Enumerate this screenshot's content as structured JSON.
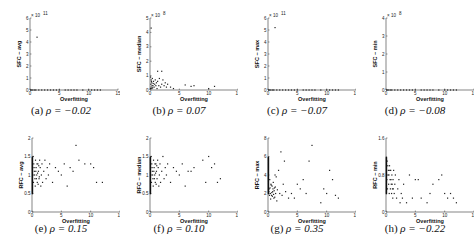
{
  "chart_data": [
    {
      "id": "a",
      "type": "scatter",
      "caption_letter": "(a)",
      "rho_label": "ρ = −0.02",
      "xlabel": "Overfitting",
      "ylabel": "SFC − avg",
      "xlim": [
        0,
        15
      ],
      "xticks": [
        "0",
        "5",
        "10",
        "15"
      ],
      "ylim": [
        0,
        6
      ],
      "yticks": [
        "0",
        "1",
        "2",
        "3",
        "4",
        "5",
        "6"
      ],
      "y_exponent": "x 10^11",
      "points": [
        [
          1.2,
          4.4
        ],
        [
          0.1,
          0
        ],
        [
          0.3,
          0
        ],
        [
          0.5,
          0
        ],
        [
          0.8,
          0
        ],
        [
          1,
          0
        ],
        [
          1.5,
          0
        ],
        [
          2,
          0
        ],
        [
          2.5,
          0
        ],
        [
          3,
          0
        ],
        [
          3.5,
          0
        ],
        [
          4,
          0
        ],
        [
          4.5,
          0
        ],
        [
          5,
          0
        ],
        [
          6,
          0
        ],
        [
          6.5,
          0
        ],
        [
          7,
          0
        ],
        [
          7.5,
          0
        ],
        [
          8,
          0
        ],
        [
          9,
          0
        ],
        [
          10,
          0
        ],
        [
          10.5,
          0
        ],
        [
          11,
          0
        ],
        [
          11.5,
          0
        ],
        [
          12,
          0
        ]
      ]
    },
    {
      "id": "b",
      "type": "scatter",
      "caption_letter": "(b)",
      "rho_label": "ρ = 0.07",
      "xlabel": "Overfitting",
      "ylabel": "SFC − median",
      "xlim": [
        0,
        15
      ],
      "xticks": [
        "0",
        "5",
        "10",
        "15"
      ],
      "ylim": [
        0,
        5
      ],
      "yticks": [
        "0",
        "1",
        "2",
        "3",
        "4",
        "5"
      ],
      "y_exponent": "x 10^8",
      "points": [
        [
          0.2,
          4.3
        ],
        [
          0.1,
          0.9
        ],
        [
          0.2,
          0.7
        ],
        [
          0.3,
          0.5
        ],
        [
          0.4,
          0.8
        ],
        [
          0.5,
          0.3
        ],
        [
          0.6,
          0.6
        ],
        [
          0.7,
          0.2
        ],
        [
          0.8,
          0.4
        ],
        [
          0.9,
          0.7
        ],
        [
          1,
          0.3
        ],
        [
          1.1,
          0.5
        ],
        [
          1.2,
          0.1
        ],
        [
          1.3,
          0.6
        ],
        [
          1.5,
          0.3
        ],
        [
          1.6,
          0.8
        ],
        [
          1.8,
          0.2
        ],
        [
          2,
          0.4
        ],
        [
          2.2,
          0.7
        ],
        [
          2.4,
          0.3
        ],
        [
          2.6,
          0.5
        ],
        [
          2.8,
          0.2
        ],
        [
          3,
          0.4
        ],
        [
          1.3,
          1.3
        ],
        [
          2,
          1.3
        ],
        [
          3.5,
          0.2
        ],
        [
          4,
          0.1
        ],
        [
          6,
          0.35
        ],
        [
          7,
          0.25
        ],
        [
          7.5,
          0.3
        ],
        [
          10,
          0.1
        ],
        [
          11,
          0.25
        ],
        [
          0.1,
          0.1
        ],
        [
          0.2,
          0.2
        ],
        [
          0.3,
          0.1
        ],
        [
          0.15,
          0.4
        ],
        [
          0.25,
          0.6
        ],
        [
          0.35,
          0.3
        ],
        [
          0.45,
          0.15
        ],
        [
          0.55,
          0.45
        ]
      ]
    },
    {
      "id": "c",
      "type": "scatter",
      "caption_letter": "(c)",
      "rho_label": "ρ = −0.07",
      "xlabel": "Overfitting",
      "ylabel": "SFC − max",
      "xlim": [
        0,
        15
      ],
      "xticks": [
        "0",
        "5",
        "10",
        "15"
      ],
      "ylim": [
        0,
        6
      ],
      "yticks": [
        "0",
        "1",
        "2",
        "3",
        "4",
        "5",
        "6"
      ],
      "y_exponent": "x 10^11",
      "points": [
        [
          1.2,
          5.2
        ],
        [
          0.1,
          0
        ],
        [
          0.3,
          0
        ],
        [
          0.5,
          0
        ],
        [
          0.8,
          0
        ],
        [
          1,
          0
        ],
        [
          1.5,
          0
        ],
        [
          2,
          0
        ],
        [
          2.5,
          0
        ],
        [
          3,
          0
        ],
        [
          3.5,
          0
        ],
        [
          4,
          0
        ],
        [
          4.5,
          0
        ],
        [
          5,
          0
        ],
        [
          6,
          0
        ],
        [
          6.5,
          0
        ],
        [
          7,
          0
        ],
        [
          7.5,
          0
        ],
        [
          8,
          0
        ],
        [
          9,
          0
        ],
        [
          10,
          0
        ],
        [
          10.5,
          0
        ],
        [
          11,
          0
        ],
        [
          11.5,
          0
        ],
        [
          12,
          0
        ]
      ]
    },
    {
      "id": "d",
      "type": "scatter",
      "caption_letter": "(d)",
      "rho_label": "ρ = −0.08",
      "xlabel": "Overfitting",
      "ylabel": "SFC − min",
      "xlim": [
        0,
        15
      ],
      "xticks": [
        "0",
        "5",
        "10",
        "15"
      ],
      "ylim": [
        0,
        4
      ],
      "yticks": [
        "0",
        "1",
        "2",
        "3",
        "4"
      ],
      "y_exponent": "x 10^8",
      "points": [
        [
          0.1,
          0
        ],
        [
          0.3,
          0
        ],
        [
          0.5,
          0
        ],
        [
          0.8,
          0
        ],
        [
          1,
          0
        ],
        [
          1.5,
          0
        ],
        [
          2,
          0
        ],
        [
          2.5,
          0
        ],
        [
          3,
          0
        ],
        [
          3.5,
          0
        ],
        [
          4,
          0
        ],
        [
          4.5,
          0
        ],
        [
          5,
          0
        ],
        [
          6,
          0
        ],
        [
          6.5,
          0
        ],
        [
          7,
          0
        ],
        [
          7.5,
          0
        ],
        [
          8,
          0
        ],
        [
          9,
          0
        ],
        [
          10,
          0
        ],
        [
          10.5,
          0
        ],
        [
          11,
          0
        ],
        [
          11.5,
          0
        ],
        [
          12,
          0
        ]
      ]
    },
    {
      "id": "e",
      "type": "scatter",
      "caption_letter": "(e)",
      "rho_label": "ρ = 0.15",
      "xlabel": "Overfitting",
      "ylabel": "RFC − avg",
      "xlim": [
        0,
        15
      ],
      "xticks": [
        "0",
        "5",
        "10",
        "15"
      ],
      "ylim": [
        0,
        2
      ],
      "yticks": [
        "0",
        "0.5",
        "1",
        "1.5",
        "2"
      ],
      "y_exponent": "",
      "points": [
        [
          0.2,
          1.5
        ],
        [
          0.3,
          1.3
        ],
        [
          0.4,
          1.1
        ],
        [
          0.5,
          0.9
        ],
        [
          0.6,
          1.4
        ],
        [
          0.7,
          1.2
        ],
        [
          0.8,
          1.0
        ],
        [
          0.9,
          0.8
        ],
        [
          1.0,
          1.3
        ],
        [
          1.1,
          1.1
        ],
        [
          1.2,
          0.9
        ],
        [
          1.3,
          1.4
        ],
        [
          1.4,
          1.2
        ],
        [
          1.5,
          0.7
        ],
        [
          1.6,
          1.0
        ],
        [
          1.7,
          1.3
        ],
        [
          1.8,
          0.8
        ],
        [
          2.0,
          1.1
        ],
        [
          2.2,
          1.4
        ],
        [
          2.4,
          0.9
        ],
        [
          2.6,
          1.2
        ],
        [
          2.8,
          1.0
        ],
        [
          3,
          1.3
        ],
        [
          3.5,
          0.8
        ],
        [
          4,
          1.2
        ],
        [
          4.5,
          1.1
        ],
        [
          5,
          1.0
        ],
        [
          5.5,
          1.3
        ],
        [
          6,
          0.7
        ],
        [
          6.5,
          1.2
        ],
        [
          7,
          1.1
        ],
        [
          7.5,
          1.8
        ],
        [
          8,
          1.4
        ],
        [
          9,
          1.3
        ],
        [
          10,
          1.3
        ],
        [
          10.5,
          1.2
        ],
        [
          11,
          0.8
        ],
        [
          12,
          0.8
        ],
        [
          0.15,
          1.0
        ],
        [
          0.25,
          0.8
        ],
        [
          0.35,
          1.2
        ],
        [
          0.45,
          1.0
        ],
        [
          0.55,
          0.7
        ],
        [
          0.65,
          1.1
        ],
        [
          0.75,
          0.9
        ],
        [
          0.85,
          1.3
        ],
        [
          0.95,
          1.05
        ],
        [
          1.05,
          0.75
        ],
        [
          1.15,
          1.25
        ],
        [
          1.25,
          0.95
        ]
      ]
    },
    {
      "id": "f",
      "type": "scatter",
      "caption_letter": "(f)",
      "rho_label": "ρ = 0.10",
      "xlabel": "Overfitting",
      "ylabel": "RFC − median",
      "xlim": [
        0,
        15
      ],
      "xticks": [
        "0",
        "5",
        "10",
        "15"
      ],
      "ylim": [
        0,
        2
      ],
      "yticks": [
        "0",
        "0.5",
        "1",
        "1.5",
        "2"
      ],
      "y_exponent": "",
      "points": [
        [
          0.2,
          1.5
        ],
        [
          0.3,
          1.3
        ],
        [
          0.4,
          1.1
        ],
        [
          0.5,
          0.9
        ],
        [
          0.6,
          1.4
        ],
        [
          0.7,
          1.2
        ],
        [
          0.8,
          1.0
        ],
        [
          0.9,
          0.8
        ],
        [
          1.0,
          1.3
        ],
        [
          1.1,
          1.1
        ],
        [
          1.2,
          0.9
        ],
        [
          1.3,
          1.4
        ],
        [
          1.4,
          1.2
        ],
        [
          1.5,
          0.7
        ],
        [
          1.6,
          1.0
        ],
        [
          1.7,
          1.3
        ],
        [
          1.8,
          0.8
        ],
        [
          2.0,
          1.1
        ],
        [
          2.2,
          1.5
        ],
        [
          2.4,
          0.9
        ],
        [
          2.6,
          1.2
        ],
        [
          2.8,
          1.0
        ],
        [
          3,
          1.3
        ],
        [
          3.5,
          0.8
        ],
        [
          4,
          1.2
        ],
        [
          4.5,
          1.1
        ],
        [
          5,
          1.0
        ],
        [
          5.5,
          1.3
        ],
        [
          6,
          0.7
        ],
        [
          6.5,
          1.1
        ],
        [
          7,
          1.1
        ],
        [
          7.5,
          1.2
        ],
        [
          9,
          1.4
        ],
        [
          9.5,
          0.8
        ],
        [
          10,
          1.5
        ],
        [
          10.5,
          1.2
        ],
        [
          11,
          1.3
        ],
        [
          11.5,
          0.8
        ],
        [
          12,
          0.9
        ],
        [
          0.15,
          1.0
        ],
        [
          0.25,
          0.8
        ],
        [
          0.35,
          1.2
        ],
        [
          0.45,
          1.0
        ],
        [
          0.55,
          0.7
        ],
        [
          0.65,
          1.1
        ],
        [
          0.75,
          0.9
        ],
        [
          0.85,
          1.3
        ],
        [
          0.95,
          1.05
        ],
        [
          1.05,
          0.75
        ],
        [
          1.15,
          1.25
        ]
      ]
    },
    {
      "id": "g",
      "type": "scatter",
      "caption_letter": "(g)",
      "rho_label": "ρ = 0.35",
      "xlabel": "Overfitting",
      "ylabel": "RFC − max",
      "xlim": [
        0,
        15
      ],
      "xticks": [
        "0",
        "5",
        "10",
        "15"
      ],
      "ylim": [
        0,
        8
      ],
      "yticks": [
        "0",
        "2",
        "4",
        "6",
        "8"
      ],
      "y_exponent": "",
      "points": [
        [
          0.2,
          2.5
        ],
        [
          0.3,
          3.5
        ],
        [
          0.4,
          2.0
        ],
        [
          0.5,
          3.0
        ],
        [
          0.6,
          1.8
        ],
        [
          0.7,
          2.8
        ],
        [
          0.8,
          2.2
        ],
        [
          0.9,
          3.2
        ],
        [
          1.0,
          1.5
        ],
        [
          1.1,
          2.6
        ],
        [
          1.2,
          4.0
        ],
        [
          1.3,
          2.0
        ],
        [
          1.4,
          3.8
        ],
        [
          1.5,
          1.2
        ],
        [
          1.6,
          2.4
        ],
        [
          1.8,
          4.5
        ],
        [
          2.0,
          2.0
        ],
        [
          2.2,
          6.5
        ],
        [
          2.4,
          1.8
        ],
        [
          2.6,
          3.0
        ],
        [
          2.8,
          5.5
        ],
        [
          3,
          2.2
        ],
        [
          3.5,
          1.5
        ],
        [
          4,
          2.0
        ],
        [
          4.5,
          1.5
        ],
        [
          5,
          3.0
        ],
        [
          5.5,
          2.5
        ],
        [
          6,
          3.5
        ],
        [
          6.5,
          2.0
        ],
        [
          7.5,
          7.2
        ],
        [
          7,
          5.5
        ],
        [
          9,
          1.0
        ],
        [
          9.5,
          2.5
        ],
        [
          10,
          2.0
        ],
        [
          10.5,
          4.5
        ],
        [
          11,
          3.5
        ],
        [
          11.5,
          1.8
        ],
        [
          12,
          1.5
        ],
        [
          0.15,
          2.2
        ],
        [
          0.25,
          1.8
        ],
        [
          0.35,
          2.6
        ],
        [
          0.45,
          1.4
        ],
        [
          0.55,
          2.9
        ],
        [
          0.65,
          2.1
        ],
        [
          0.75,
          1.7
        ],
        [
          0.85,
          2.5
        ],
        [
          0.95,
          1.9
        ],
        [
          1.05,
          2.3
        ],
        [
          1.15,
          1.6
        ],
        [
          1.25,
          2.7
        ]
      ]
    },
    {
      "id": "h",
      "type": "scatter",
      "caption_letter": "(h)",
      "rho_label": "ρ = −0.22",
      "xlabel": "Overfitting",
      "ylabel": "RFC − min",
      "xlim": [
        0,
        15
      ],
      "xticks": [
        "0",
        "5",
        "10",
        "15"
      ],
      "ylim": [
        0,
        1.6
      ],
      "yticks": [
        "0",
        "0.8",
        "1.6"
      ],
      "y_exponent": "",
      "points": [
        [
          0.2,
          1.1
        ],
        [
          0.3,
          1.0
        ],
        [
          0.4,
          0.9
        ],
        [
          0.5,
          0.8
        ],
        [
          0.6,
          1.0
        ],
        [
          0.7,
          0.7
        ],
        [
          0.8,
          0.9
        ],
        [
          0.9,
          0.6
        ],
        [
          1.0,
          0.8
        ],
        [
          1.1,
          0.5
        ],
        [
          1.2,
          0.7
        ],
        [
          1.3,
          0.9
        ],
        [
          1.4,
          0.4
        ],
        [
          1.5,
          0.6
        ],
        [
          1.6,
          0.8
        ],
        [
          1.8,
          0.3
        ],
        [
          2.0,
          0.5
        ],
        [
          2.2,
          0.7
        ],
        [
          2.4,
          0.2
        ],
        [
          2.6,
          0.4
        ],
        [
          2.8,
          0.3
        ],
        [
          3,
          0.6
        ],
        [
          3.5,
          0.2
        ],
        [
          4,
          0.8
        ],
        [
          4.5,
          0.3
        ],
        [
          5,
          0.7
        ],
        [
          5.5,
          0.7
        ],
        [
          6,
          0.3
        ],
        [
          7,
          0.2
        ],
        [
          7.5,
          0.4
        ],
        [
          8,
          0.6
        ],
        [
          9,
          0.7
        ],
        [
          9.5,
          0.8
        ],
        [
          10,
          0.4
        ],
        [
          10.5,
          0.3
        ],
        [
          11,
          0.4
        ],
        [
          11.5,
          0.3
        ],
        [
          12,
          0.2
        ],
        [
          0.15,
          0.7
        ],
        [
          0.25,
          0.5
        ],
        [
          0.35,
          0.8
        ],
        [
          0.45,
          0.6
        ],
        [
          0.55,
          0.4
        ],
        [
          0.65,
          0.9
        ],
        [
          0.75,
          0.5
        ],
        [
          0.85,
          0.7
        ],
        [
          0.95,
          0.4
        ],
        [
          1.05,
          0.6
        ],
        [
          1.15,
          0.3
        ],
        [
          1.25,
          0.5
        ]
      ]
    }
  ]
}
